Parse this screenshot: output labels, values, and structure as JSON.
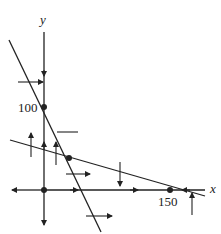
{
  "diagram": {
    "type": "phase-plane",
    "axes": {
      "x_label": "x",
      "y_label": "y"
    },
    "tick_labels": {
      "y_intercept": "100",
      "x_intercept": "150"
    },
    "equilibria": [
      {
        "name": "origin",
        "x": 0,
        "y": 0
      },
      {
        "name": "y-axis-equilibrium",
        "x": 0,
        "y": 100
      },
      {
        "name": "interior-equilibrium",
        "x": "intersection",
        "y": "intersection"
      },
      {
        "name": "x-axis-equilibrium",
        "x": 150,
        "y": 0
      }
    ],
    "nullclines": [
      {
        "name": "steep-nullcline",
        "description": "steep line through (0,100)"
      },
      {
        "name": "shallow-nullcline",
        "description": "shallow line through (150,0)"
      }
    ],
    "colors": {
      "ink": "#222222",
      "background": "#ffffff"
    }
  }
}
